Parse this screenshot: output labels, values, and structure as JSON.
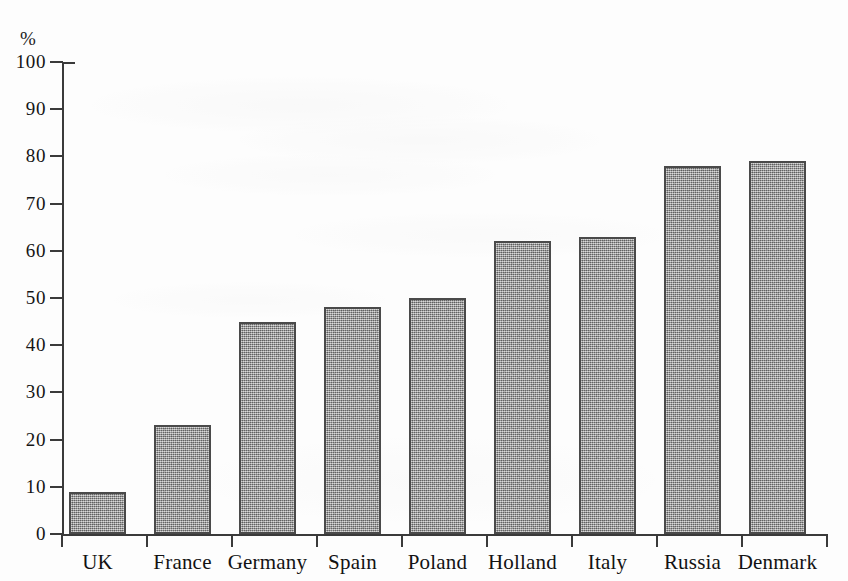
{
  "chart_data": {
    "type": "bar",
    "title": "",
    "subtitle": "",
    "xlabel": "",
    "ylabel": "%",
    "y_unit_label": "%",
    "categories": [
      "UK",
      "France",
      "Germany",
      "Spain",
      "Poland",
      "Holland",
      "Italy",
      "Russia",
      "Denmark"
    ],
    "values": [
      9,
      23,
      45,
      48,
      50,
      62,
      63,
      78,
      79
    ],
    "series": [
      {
        "name": "",
        "values": [
          9,
          23,
          45,
          48,
          50,
          62,
          63,
          78,
          79
        ]
      }
    ],
    "ylim": [
      0,
      100
    ],
    "ytick_values": [
      0,
      10,
      20,
      30,
      40,
      50,
      60,
      70,
      80,
      90,
      100
    ],
    "ytick_labels": [
      "0",
      "10",
      "20",
      "30",
      "40",
      "50",
      "60",
      "70",
      "80",
      "90",
      "100"
    ],
    "ytick_step": 10,
    "grid": false,
    "legend": false,
    "legend_position": "none",
    "annotations": [],
    "bar_fill_color": "#8e8e8e",
    "bar_edge_color": "#4a4a4a",
    "axis_color": "#3a3a3a",
    "background_color": "#fdfdfd",
    "text_color": "#151515"
  }
}
